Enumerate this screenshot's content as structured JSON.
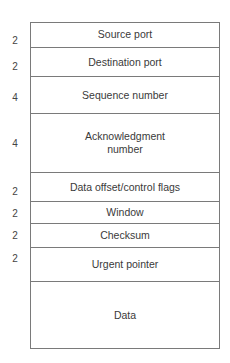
{
  "diagram": {
    "title": "",
    "fields": [
      {
        "label": "Source port",
        "size": "2"
      },
      {
        "label": "Destination port",
        "size": "2"
      },
      {
        "label": "Sequence number",
        "size": "4"
      },
      {
        "label": "Acknowledgment number",
        "label_line1": "Acknowledgment",
        "label_line2": "number",
        "size": "4"
      },
      {
        "label": "Data offset/control flags",
        "size": "2"
      },
      {
        "label": "Window",
        "size": "2"
      },
      {
        "label": "Checksum",
        "size": "2"
      },
      {
        "label": "Urgent pointer",
        "size": "2"
      },
      {
        "label": "Data",
        "size": ""
      }
    ],
    "colors": {
      "line": "#7a7a7a",
      "text": "#3a3a3a",
      "background": "#ffffff"
    }
  }
}
